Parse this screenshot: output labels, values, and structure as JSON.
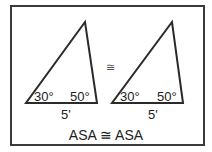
{
  "diagram": {
    "triangles": [
      {
        "id": "left",
        "angle_left": "30°",
        "angle_right": "50°",
        "side": "5'"
      },
      {
        "id": "right",
        "angle_left": "30°",
        "angle_right": "50°",
        "side": "5'"
      }
    ],
    "congruence_symbol": "≅",
    "caption": "ASA ≅ ASA",
    "colors": {
      "stroke": "#2a2a2a",
      "border": "#3a3a3a",
      "background": "#ffffff"
    }
  }
}
